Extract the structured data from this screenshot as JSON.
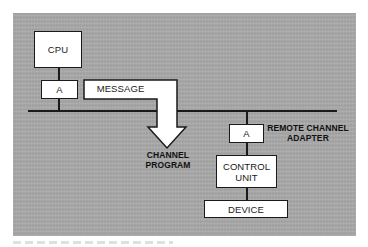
{
  "diagram": {
    "type": "block-diagram",
    "nodes": {
      "cpu": {
        "label": "CPU"
      },
      "adapter_local": {
        "label": "A"
      },
      "message": {
        "label": "MESSAGE"
      },
      "adapter_remote": {
        "label": "A"
      },
      "control_unit": {
        "label_line1": "CONTROL",
        "label_line2": "UNIT"
      },
      "device": {
        "label": "DEVICE"
      }
    },
    "annotations": {
      "channel_program_line1": "CHANNEL",
      "channel_program_line2": "PROGRAM",
      "remote_adapter_line1": "REMOTE CHANNEL",
      "remote_adapter_line2": "ADAPTER"
    },
    "edges": [
      {
        "from": "cpu",
        "to": "adapter_local"
      },
      {
        "from": "adapter_local",
        "to": "bus"
      },
      {
        "from": "bus",
        "to": "adapter_remote"
      },
      {
        "from": "adapter_remote",
        "to": "control_unit"
      },
      {
        "from": "control_unit",
        "to": "device"
      },
      {
        "from": "message",
        "to": "channel_program",
        "style": "bent-arrow"
      }
    ],
    "colors": {
      "panel": "#a9a9a9",
      "box_fill": "#ffffff",
      "stroke": "#1a1a1a"
    }
  }
}
